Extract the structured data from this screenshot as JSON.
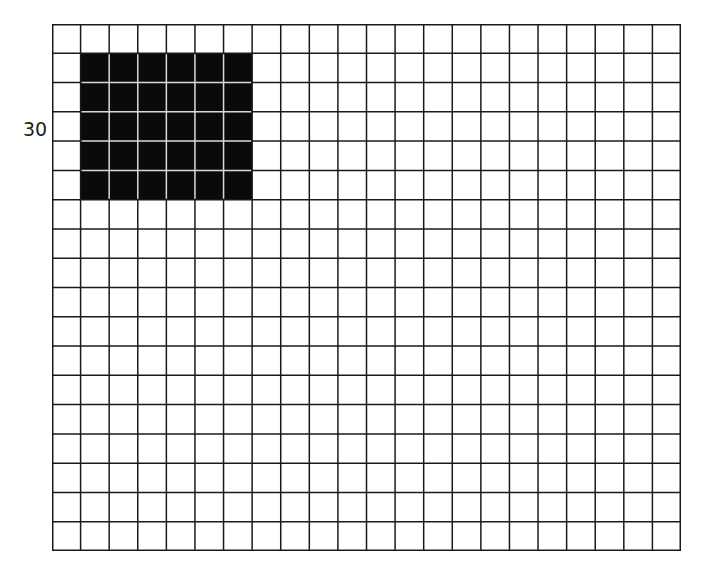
{
  "figure": {
    "label": "30",
    "grid": {
      "columns": 22,
      "rows": 18
    },
    "shaded_region": {
      "col_start": 1,
      "col_end": 6,
      "row_start": 1,
      "row_end": 5,
      "columns": 6,
      "rows": 5
    },
    "colors": {
      "line": "#1a1a1a",
      "fill": "#0a0a0a",
      "fill_line": "#d8d8d8",
      "background": "#ffffff"
    }
  }
}
